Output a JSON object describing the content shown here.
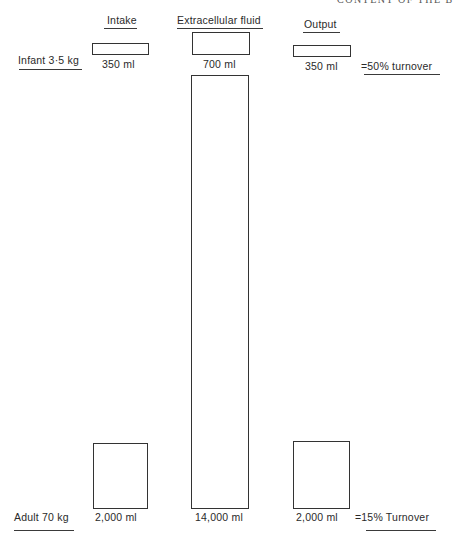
{
  "running_head": "CONTENT OF THE B",
  "columns": {
    "intake": "Intake",
    "ecf": "Extracellular fluid",
    "output": "Output"
  },
  "infant": {
    "label": "Infant 3·5 kg",
    "intake": "350 ml",
    "ecf": "700 ml",
    "output": "350 ml",
    "turnover": "=50% turnover"
  },
  "adult": {
    "label": "Adult 70 kg",
    "intake": "2,000 ml",
    "ecf": "14,000 ml",
    "output": "2,000 ml",
    "turnover": "=15% Turnover"
  },
  "colors": {
    "line": "#333333",
    "text": "#2a2a2a",
    "background": "#ffffff"
  }
}
